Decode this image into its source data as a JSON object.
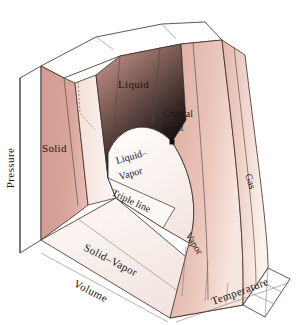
{
  "figure": {
    "background_color": "#ffffff"
  },
  "axes": {
    "pressure": {
      "label": "Pressure",
      "orientation": "vertical-left"
    },
    "volume": {
      "label": "Volume",
      "orientation": "oblique-bottom-left"
    },
    "temperature": {
      "label": "Temperature",
      "orientation": "oblique-bottom-right"
    }
  },
  "regions": [
    {
      "id": "solid",
      "label": "Solid",
      "color": "#d4a096"
    },
    {
      "id": "liquid",
      "label": "Liquid",
      "color": "#d7a399"
    },
    {
      "id": "liquid-vapor",
      "label_line1": "Liquid–",
      "label_line2": "Vapor",
      "color": "#fbf4f1"
    },
    {
      "id": "solid-vapor",
      "label": "Solid–Vapor",
      "color": "#f7eeea"
    },
    {
      "id": "vapor",
      "label": "Vapor",
      "color": "#e5bdb2"
    },
    {
      "id": "gas",
      "label": "Gas",
      "color": "#eccdc3"
    },
    {
      "id": "triple-line",
      "label": "Triple line",
      "color": "#fdf9f7"
    }
  ],
  "annotations": {
    "critical_point": {
      "label_line1": "Critical",
      "label_line2": "point",
      "marker": "critical-point-dot",
      "marker_color": "#12100f"
    }
  },
  "colors": {
    "solid_fill": "#d4a096",
    "liquid_fill": "#d7a399",
    "vapor_fill": "#e5bdb2",
    "gas_fill": "#eccdc3",
    "dome_fill": "#fbf4f1",
    "solid_vapor_fill": "#f7eeea",
    "triple_line_fill": "#fdf9f7",
    "back_plane_fill": "#ffffff",
    "outline_stroke": "#3a2b26"
  }
}
